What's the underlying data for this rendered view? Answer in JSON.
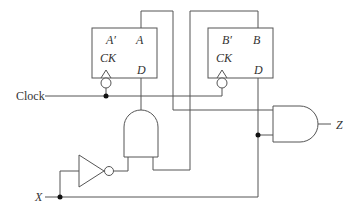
{
  "diagram": {
    "type": "sequential-logic-circuit",
    "flipflop_a": {
      "q_bar": "A′",
      "q": "A",
      "clock": "CK",
      "d": "D"
    },
    "flipflop_b": {
      "q_bar": "B′",
      "q": "B",
      "clock": "CK",
      "d": "D"
    },
    "inputs": {
      "clock": "Clock",
      "x": "X"
    },
    "outputs": {
      "z": "Z"
    },
    "gates": [
      "and-gate-left",
      "and-gate-right",
      "inverter"
    ]
  }
}
